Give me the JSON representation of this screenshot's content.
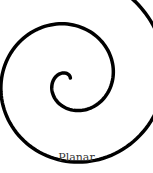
{
  "figure": {
    "caption": "Planar",
    "shape": "planar-spiral",
    "stroke_color": "#000000",
    "stroke_width": 3.5,
    "center": [
      70,
      80
    ],
    "turns": 3.05,
    "growth_per_radian": 8.3,
    "start_radius": 2,
    "start_angle_deg": -80
  }
}
